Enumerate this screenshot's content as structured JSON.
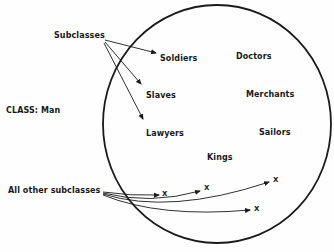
{
  "diagram": {
    "class_label": "CLASS: Man",
    "subclasses_label": "Subclasses",
    "other_label": "All other subclasses",
    "members": [
      {
        "name": "Soldiers"
      },
      {
        "name": "Doctors"
      },
      {
        "name": "Slaves"
      },
      {
        "name": "Merchants"
      },
      {
        "name": "Lawyers"
      },
      {
        "name": "Sailors"
      },
      {
        "name": "Kings"
      }
    ],
    "unknown_marks": [
      "X",
      "X",
      "X",
      "X"
    ],
    "colors": {
      "ink": "#1a1a1a",
      "paper": "#fefefe"
    }
  }
}
